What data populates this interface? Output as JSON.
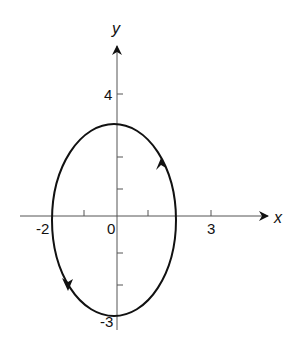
{
  "figure": {
    "type": "parametric-curve-phase-portrait",
    "axes": {
      "x_label": "x",
      "y_label": "y",
      "x_tick_labels": [
        {
          "value": -2,
          "text": "-2"
        },
        {
          "value": 0,
          "text": "0"
        },
        {
          "value": 3,
          "text": "3"
        }
      ],
      "y_tick_labels": [
        {
          "value": 4,
          "text": "4"
        },
        {
          "value": -3,
          "text": "-3"
        }
      ],
      "x_ticks": [
        -2,
        -1,
        0,
        1,
        2,
        3
      ],
      "y_ticks": [
        4,
        3,
        2,
        1,
        -1,
        -2,
        -3
      ]
    },
    "curve": {
      "shape": "ellipse",
      "center": [
        0,
        0
      ],
      "x_semi_axis": 2,
      "y_semi_axis": 3,
      "direction": "counterclockwise",
      "stroke_color": "#111111"
    },
    "arrows": [
      {
        "position": "right side, upper",
        "direction": "up"
      },
      {
        "position": "left side, lower",
        "direction": "down"
      }
    ]
  }
}
